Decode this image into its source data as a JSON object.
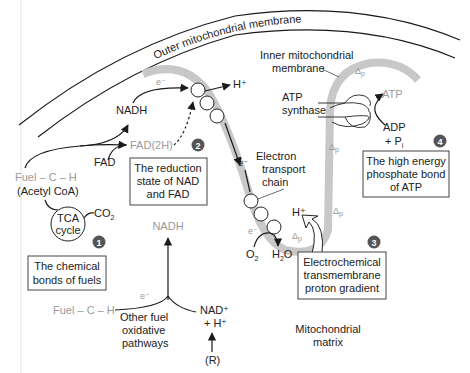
{
  "colors": {
    "membrane_band": "#c8c8c8",
    "badge": "#555555",
    "gray_text": "#9a9a9a",
    "text": "#222222",
    "line": "#1a1a1a"
  },
  "membranes": {
    "outer_label": "Outer mitochondrial membrane",
    "inner_label_line1": "Inner mitochondrial",
    "inner_label_line2": "membrane",
    "matrix_line1": "Mitochondrial",
    "matrix_line2": "matrix"
  },
  "molecules": {
    "nadh_top": "NADH",
    "fad": "FAD",
    "fad2h": "FAD(2H)",
    "fuel_top": "Fuel – C – H",
    "acetyl_coa": "(Acetyl CoA)",
    "tca_line1": "TCA",
    "tca_line2": "cycle",
    "co2": "CO",
    "co2_sub": "2",
    "e_minus_top": "e⁻",
    "h_plus_top": "H⁺",
    "e_minus_etc": "e⁻",
    "etc_line1": "Electron",
    "etc_line2": "transport",
    "etc_line3": "chain",
    "e_minus_bottom": "e⁻",
    "o2": "O",
    "o2_sub": "2",
    "h2o_h": "H",
    "h2o_sub": "2",
    "h2o_o": "O",
    "h_plus_bottom": "H⁺",
    "atp_synthase_line1": "ATP",
    "atp_synthase_line2": "synthase",
    "atp": "ATP",
    "adp": "ADP",
    "pi": "+ P",
    "pi_sub": "i",
    "nadh_bottom": "NADH",
    "e_minus_lower": "e⁻",
    "fuel_bottom": "Fuel – C – H",
    "other_line1": "Other fuel",
    "other_line2": "oxidative",
    "other_line3": "pathways",
    "nad_plus": "NAD⁺",
    "h_plus_nad": "+ H⁺",
    "r": "(R)",
    "delta_p": "Δ",
    "delta_p_sub": "p"
  },
  "boxes": [
    {
      "number": "1",
      "line1": "The chemical",
      "line2": "bonds of fuels"
    },
    {
      "number": "2",
      "line1": "The reduction",
      "line2": "state of NAD",
      "line3": "and FAD"
    },
    {
      "number": "3",
      "line1": "Electrochemical",
      "line2": "transmembrane",
      "line3": "proton gradient"
    },
    {
      "number": "4",
      "line1": "The high energy",
      "line2": "phosphate bond",
      "line3": "of ATP"
    }
  ]
}
